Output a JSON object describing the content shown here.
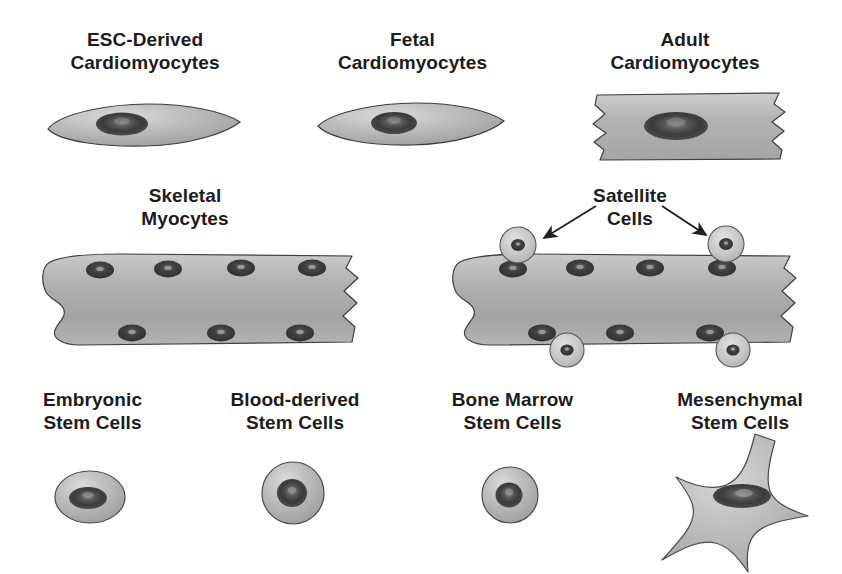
{
  "figure": {
    "background_color": "#ffffff",
    "body_fill_light": "#d2d2d2",
    "body_fill_mid": "#a9a9a9",
    "body_fill_dark": "#8d8d8d",
    "nucleus_dark": "#4a4a4a",
    "nucleus_core": "#2e2e2e",
    "nucleus_highlight": "#9a9a9a",
    "outline_color": "#3a3a3a",
    "text_color": "#1c1c1c"
  },
  "rows": {
    "top": {
      "cells": [
        {
          "id": "esc-derived-cardiomyocytes",
          "label": "ESC-Derived\nCardiomyocytes",
          "shape": "spindle",
          "nuclei_count": 1
        },
        {
          "id": "fetal-cardiomyocytes",
          "label": "Fetal\nCardiomyocytes",
          "shape": "spindle",
          "nuclei_count": 1
        },
        {
          "id": "adult-cardiomyocytes",
          "label": "Adult\nCardiomyocytes",
          "shape": "rod-with-intercalated-discs",
          "nuclei_count": 1
        }
      ]
    },
    "middle": {
      "cells": [
        {
          "id": "skeletal-myocytes",
          "label": "Skeletal\nMyocytes",
          "shape": "multinucleated-fiber",
          "nuclei_top": 4,
          "nuclei_bottom": 3,
          "satellite_cells": 0
        },
        {
          "id": "skeletal-myocytes-with-satellite-cells",
          "label": "Satellite\nCells",
          "shape": "multinucleated-fiber",
          "nuclei_top": 4,
          "nuclei_bottom": 3,
          "satellite_cells": 4,
          "satellite_top": 2,
          "satellite_bottom": 2,
          "arrow_count": 2
        }
      ]
    },
    "bottom": {
      "cells": [
        {
          "id": "embryonic-stem-cells",
          "label": "Embryonic\nStem Cells",
          "shape": "oval",
          "nuclei_count": 1
        },
        {
          "id": "blood-derived-stem-cells",
          "label": "Blood-derived\nStem Cells",
          "shape": "round",
          "nuclei_count": 1
        },
        {
          "id": "bone-marrow-stem-cells",
          "label": "Bone Marrow\nStem Cells",
          "shape": "round",
          "nuclei_count": 1
        },
        {
          "id": "mesenchymal-stem-cells",
          "label": "Mesenchymal\nStem Cells",
          "shape": "stellate",
          "nuclei_count": 1
        }
      ]
    }
  }
}
